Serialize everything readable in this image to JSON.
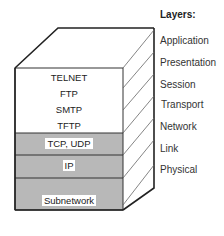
{
  "legend": {
    "title": "Layers:",
    "layers": [
      "Application",
      "Presentation",
      "Session",
      "Transport",
      "Network",
      "Link",
      "Physical"
    ]
  },
  "stack": {
    "application_protocols": [
      "TELNET",
      "FTP",
      "SMTP",
      "TFTP"
    ],
    "transport": "TCP, UDP",
    "network": "IP",
    "link_physical": "Subnetwork"
  },
  "colors": {
    "outline": "#222222",
    "shaded_band": "#b8b8b8",
    "face": "#ffffff"
  }
}
